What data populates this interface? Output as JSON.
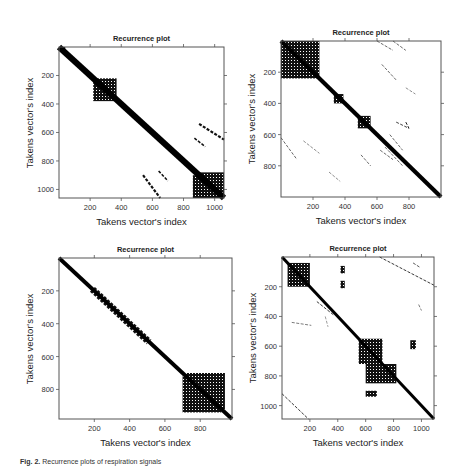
{
  "figure": {
    "caption_label": "Fig. 2.",
    "caption_text": "Recurrence plots of respiration signals"
  },
  "chart_data": [
    {
      "type": "heatmap",
      "title": "Recurrence plot",
      "xlabel": "Takens vector's index",
      "ylabel": "Takens vector's index",
      "xlim": [
        0,
        1060
      ],
      "ylim": [
        1060,
        0
      ],
      "xticks": [
        200,
        400,
        600,
        800,
        1000
      ],
      "yticks": [
        200,
        400,
        600,
        800,
        1000
      ],
      "grid": false,
      "description": "Dense main diagonal; dense block ~220-370; large block ~880-1060; off-diagonal streaks near x 540-650 y 900-1060 and x 900-1060 y 540-650"
    },
    {
      "type": "heatmap",
      "title": "Recurrence plot",
      "xlabel": "Takens vector's index",
      "ylabel": "Takens vector's index",
      "xlim": [
        0,
        1000
      ],
      "ylim": [
        1000,
        0
      ],
      "xticks": [
        200,
        400,
        600,
        800
      ],
      "yticks": [
        200,
        400,
        600,
        800
      ],
      "grid": false,
      "description": "Dense block 0-240 with diagonal stripes; dense block ~480-560; scattered off-diagonal short lines"
    },
    {
      "type": "heatmap",
      "title": "Recurrence plot",
      "xlabel": "Takens vector's index",
      "ylabel": "Takens vector's index",
      "xlim": [
        0,
        980
      ],
      "ylim": [
        980,
        0
      ],
      "xticks": [
        200,
        400,
        600,
        800
      ],
      "yticks": [
        200,
        400,
        600,
        800
      ],
      "grid": false,
      "description": "Thin main diagonal thickening 200-500 with hatching; checkered block ~700-920"
    },
    {
      "type": "heatmap",
      "title": "Recurrence plot",
      "xlabel": "Takens vector's index",
      "ylabel": "Takens vector's index",
      "xlim": [
        0,
        1090
      ],
      "ylim": [
        1090,
        0
      ],
      "xticks": [
        200,
        400,
        600,
        800,
        1000
      ],
      "yticks": [
        200,
        400,
        600,
        800,
        1000
      ],
      "grid": false,
      "description": "Block ~40-200; large block ~550-720 with spread to 850; small clusters at (420-450,60-200), (600-680,900-940), (920-960,540-620); corner streaks"
    }
  ],
  "panels": [
    {
      "title": "Recurrence plot",
      "xlabel": "Takens vector's index",
      "ylabel": "Takens vector's index",
      "box": {
        "x": 59,
        "y": 47,
        "w": 165,
        "h": 151
      },
      "max": 1060,
      "xticks": [
        {
          "v": 200,
          "l": "200"
        },
        {
          "v": 400,
          "l": "400"
        },
        {
          "v": 600,
          "l": "600"
        },
        {
          "v": 800,
          "l": "800"
        },
        {
          "v": 1000,
          "l": "1000"
        }
      ],
      "yticks": [
        {
          "v": 200,
          "l": "200"
        },
        {
          "v": 400,
          "l": "400"
        },
        {
          "v": 600,
          "l": "600"
        },
        {
          "v": 800,
          "l": "800"
        },
        {
          "v": 1000,
          "l": "1000"
        }
      ],
      "diag_width": 40,
      "blocks": [
        [
          0,
          0,
          40,
          25
        ],
        [
          220,
          220,
          370,
          380
        ],
        [
          880,
          880,
          1060,
          1060
        ],
        [
          860,
          900,
          960,
          1060
        ]
      ],
      "streaks": [
        [
          540,
          900,
          650,
          1060,
          14
        ],
        [
          900,
          540,
          1060,
          650,
          14
        ],
        [
          640,
          870,
          700,
          940,
          10
        ],
        [
          870,
          640,
          940,
          700,
          10
        ],
        [
          570,
          570,
          600,
          610,
          6
        ]
      ]
    },
    {
      "title": "Recurrence plot",
      "xlabel": "Takens vector's index",
      "ylabel": "Takens vector's index",
      "box": {
        "x": 281,
        "y": 41,
        "w": 160,
        "h": 156
      },
      "max": 1000,
      "xticks": [
        {
          "v": 200,
          "l": "200"
        },
        {
          "v": 400,
          "l": "400"
        },
        {
          "v": 600,
          "l": "600"
        },
        {
          "v": 800,
          "l": "800"
        }
      ],
      "yticks": [
        {
          "v": 200,
          "l": "200"
        },
        {
          "v": 400,
          "l": "400"
        },
        {
          "v": 600,
          "l": "600"
        },
        {
          "v": 800,
          "l": "800"
        }
      ],
      "diag_width": 26,
      "blocks": [
        [
          0,
          0,
          240,
          240
        ],
        [
          480,
          480,
          560,
          560
        ],
        [
          330,
          340,
          390,
          400
        ]
      ],
      "streaks": [
        [
          600,
          0,
          700,
          60,
          4
        ],
        [
          700,
          0,
          780,
          60,
          4
        ],
        [
          630,
          150,
          720,
          250,
          4
        ],
        [
          780,
          300,
          840,
          340,
          3
        ],
        [
          0,
          620,
          100,
          760,
          4
        ],
        [
          140,
          640,
          240,
          720,
          3
        ],
        [
          300,
          840,
          370,
          900,
          3
        ],
        [
          500,
          730,
          560,
          800,
          4
        ],
        [
          720,
          520,
          800,
          560,
          5
        ],
        [
          680,
          600,
          760,
          700,
          4
        ],
        [
          650,
          680,
          760,
          800,
          4
        ],
        [
          620,
          700,
          700,
          760,
          4
        ],
        [
          780,
          520,
          800,
          560,
          6
        ]
      ]
    },
    {
      "title": "Recurrence plot",
      "xlabel": "Takens vector's index",
      "ylabel": "Takens vector's index",
      "box": {
        "x": 59,
        "y": 258,
        "w": 173,
        "h": 161
      },
      "max": 980,
      "xticks": [
        {
          "v": 200,
          "l": "200"
        },
        {
          "v": 400,
          "l": "400"
        },
        {
          "v": 600,
          "l": "600"
        },
        {
          "v": 800,
          "l": "800"
        }
      ],
      "yticks": [
        {
          "v": 200,
          "l": "200"
        },
        {
          "v": 400,
          "l": "400"
        },
        {
          "v": 600,
          "l": "600"
        },
        {
          "v": 800,
          "l": "800"
        }
      ],
      "diag_width": 22,
      "blocks": [
        [
          700,
          720,
          920,
          940
        ],
        [
          720,
          700,
          940,
          920
        ]
      ],
      "streaks": [
        [
          180,
          200,
          500,
          520,
          14
        ],
        [
          200,
          180,
          520,
          500,
          10
        ]
      ]
    },
    {
      "title": "Recurrence plot",
      "xlabel": "Takens vector's index",
      "ylabel": "Takens vector's index",
      "box": {
        "x": 282,
        "y": 257,
        "w": 152,
        "h": 162
      },
      "max": 1090,
      "xticks": [
        {
          "v": 200,
          "l": "200"
        },
        {
          "v": 400,
          "l": "400"
        },
        {
          "v": 600,
          "l": "600"
        },
        {
          "v": 800,
          "l": "800"
        },
        {
          "v": 1000,
          "l": "1000"
        }
      ],
      "yticks": [
        {
          "v": 200,
          "l": "200"
        },
        {
          "v": 400,
          "l": "400"
        },
        {
          "v": 600,
          "l": "600"
        },
        {
          "v": 800,
          "l": "800"
        },
        {
          "v": 1000,
          "l": "1000"
        }
      ],
      "diag_width": 22,
      "blocks": [
        [
          40,
          40,
          200,
          200
        ],
        [
          550,
          550,
          720,
          720
        ],
        [
          600,
          900,
          680,
          940
        ],
        [
          920,
          560,
          960,
          620
        ],
        [
          420,
          60,
          450,
          110
        ],
        [
          420,
          160,
          450,
          210
        ],
        [
          600,
          720,
          820,
          850
        ]
      ],
      "streaks": [
        [
          700,
          0,
          1090,
          190,
          6
        ],
        [
          0,
          920,
          190,
          1090,
          6
        ],
        [
          70,
          440,
          210,
          460,
          4
        ],
        [
          940,
          40,
          990,
          70,
          5
        ],
        [
          980,
          320,
          1000,
          360,
          4
        ],
        [
          250,
          300,
          370,
          390,
          6
        ],
        [
          310,
          400,
          330,
          470,
          3
        ]
      ]
    }
  ]
}
